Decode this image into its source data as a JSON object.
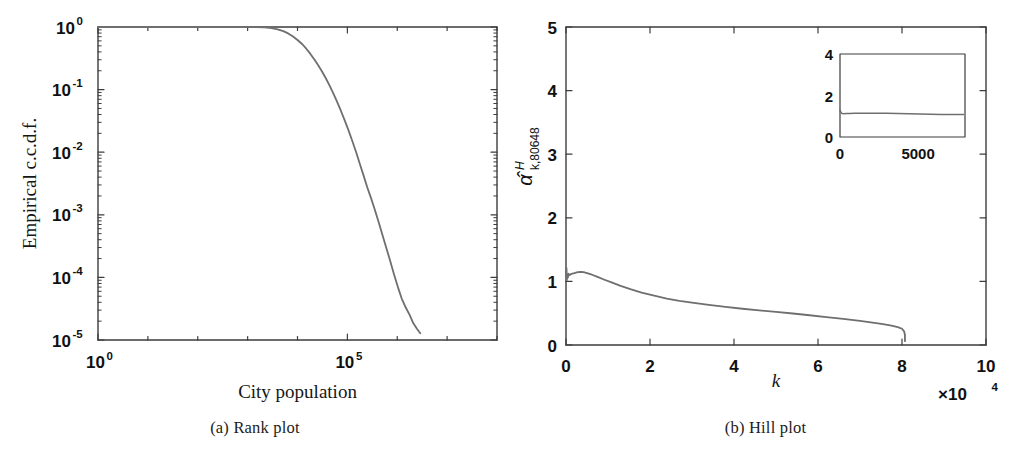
{
  "figure": {
    "background": "#ffffff",
    "curve_color": "#6f6f6f",
    "axis_color": "#3d3d3d",
    "text_color": "#111111"
  },
  "panels": [
    {
      "id": "a",
      "caption": "(a) Rank plot",
      "chart_data": {
        "type": "line",
        "title": "",
        "xlabel": "City population",
        "ylabel": "Empirical c.c.d.f.",
        "xscale": "log",
        "yscale": "log",
        "xlim": [
          1,
          100000000
        ],
        "ylim": [
          1e-05,
          1
        ],
        "grid": false,
        "legend": null,
        "xticks": [
          {
            "value": 1,
            "label_mantissa": "10",
            "label_exponent": "0"
          },
          {
            "value": 100000,
            "label_mantissa": "10",
            "label_exponent": "5"
          }
        ],
        "yticks": [
          {
            "value": 1,
            "label_mantissa": "10",
            "label_exponent": "0"
          },
          {
            "value": 0.1,
            "label_mantissa": "10",
            "label_exponent": "-1"
          },
          {
            "value": 0.01,
            "label_mantissa": "10",
            "label_exponent": "-2"
          },
          {
            "value": 0.001,
            "label_mantissa": "10",
            "label_exponent": "-3"
          },
          {
            "value": 0.0001,
            "label_mantissa": "10",
            "label_exponent": "-4"
          },
          {
            "value": 1e-05,
            "label_mantissa": "10",
            "label_exponent": "-5"
          }
        ],
        "series": [
          {
            "name": "empirical ccdf of city population",
            "points": [
              [
                1,
                1.0
              ],
              [
                10,
                1.0
              ],
              [
                100,
                1.0
              ],
              [
                300,
                1.0
              ],
              [
                800,
                0.999
              ],
              [
                1500,
                0.996
              ],
              [
                2200,
                0.985
              ],
              [
                3000,
                0.96
              ],
              [
                4000,
                0.92
              ],
              [
                5200,
                0.86
              ],
              [
                6500,
                0.79
              ],
              [
                8000,
                0.71
              ],
              [
                10000,
                0.62
              ],
              [
                12500,
                0.53
              ],
              [
                15000,
                0.45
              ],
              [
                18000,
                0.375
              ],
              [
                22000,
                0.3
              ],
              [
                26000,
                0.245
              ],
              [
                31000,
                0.195
              ],
              [
                37000,
                0.152
              ],
              [
                44000,
                0.116
              ],
              [
                52000,
                0.088
              ],
              [
                62000,
                0.064
              ],
              [
                74000,
                0.046
              ],
              [
                88000,
                0.0325
              ],
              [
                105000,
                0.0225
              ],
              [
                125000,
                0.0152
              ],
              [
                150000,
                0.01
              ],
              [
                178000,
                0.0065
              ],
              [
                210000,
                0.0043
              ],
              [
                250000,
                0.00275
              ],
              [
                295000,
                0.0019
              ],
              [
                350000,
                0.00125
              ],
              [
                420000,
                0.00078
              ],
              [
                500000,
                0.00049
              ],
              [
                600000,
                0.0003
              ],
              [
                720000,
                0.000185
              ],
              [
                860000,
                0.000112
              ],
              [
                1030000,
                7e-05
              ],
              [
                1230000,
                4.6e-05
              ],
              [
                1480000,
                3.3e-05
              ],
              [
                1780000,
                2.5e-05
              ],
              [
                2100000,
                1.85e-05
              ],
              [
                2500000,
                1.5e-05
              ],
              [
                2750000,
                1.35e-05
              ],
              [
                2900000,
                1.28e-05
              ]
            ]
          }
        ]
      }
    },
    {
      "id": "b",
      "caption": "(b) Hill plot",
      "chart_data": {
        "type": "line",
        "title": "",
        "xlabel": "k",
        "ylabel": "α̂",
        "ylabel_superscript": "H",
        "ylabel_subscript": "k,80648",
        "xscale": "linear",
        "yscale": "linear",
        "xlim": [
          0,
          10
        ],
        "ylim": [
          0,
          5
        ],
        "x_exponent_label": "×10",
        "x_exponent_power": "4",
        "grid": false,
        "legend": null,
        "xticks": [
          0,
          2,
          4,
          6,
          8,
          10
        ],
        "yticks": [
          0,
          1,
          2,
          3,
          4,
          5
        ],
        "series": [
          {
            "name": "Hill estimator",
            "points": [
              [
                0.0,
                1.1
              ],
              [
                0.012,
                1.21
              ],
              [
                0.02,
                1.02
              ],
              [
                0.03,
                1.11
              ],
              [
                0.045,
                1.06
              ],
              [
                0.06,
                1.12
              ],
              [
                0.09,
                1.1
              ],
              [
                0.13,
                1.12
              ],
              [
                0.2,
                1.13
              ],
              [
                0.28,
                1.145
              ],
              [
                0.35,
                1.15
              ],
              [
                0.42,
                1.145
              ],
              [
                0.5,
                1.13
              ],
              [
                0.62,
                1.105
              ],
              [
                0.75,
                1.07
              ],
              [
                0.9,
                1.03
              ],
              [
                1.1,
                0.98
              ],
              [
                1.3,
                0.93
              ],
              [
                1.55,
                0.875
              ],
              [
                1.8,
                0.825
              ],
              [
                2.1,
                0.775
              ],
              [
                2.4,
                0.73
              ],
              [
                2.7,
                0.695
              ],
              [
                3.0,
                0.665
              ],
              [
                3.4,
                0.63
              ],
              [
                3.8,
                0.6
              ],
              [
                4.2,
                0.57
              ],
              [
                4.6,
                0.545
              ],
              [
                5.0,
                0.52
              ],
              [
                5.4,
                0.495
              ],
              [
                5.8,
                0.468
              ],
              [
                6.2,
                0.44
              ],
              [
                6.6,
                0.41
              ],
              [
                7.0,
                0.378
              ],
              [
                7.3,
                0.352
              ],
              [
                7.55,
                0.328
              ],
              [
                7.75,
                0.305
              ],
              [
                7.9,
                0.282
              ],
              [
                8.0,
                0.255
              ],
              [
                8.05,
                0.215
              ],
              [
                8.07,
                0.16
              ],
              [
                8.07,
                0.06
              ]
            ]
          }
        ],
        "inset": {
          "xlim": [
            0,
            8000
          ],
          "ylim": [
            0,
            4
          ],
          "xticks": [
            {
              "value": 0,
              "label": "0"
            },
            {
              "value": 5000,
              "label": "5000"
            }
          ],
          "yticks": [
            {
              "value": 0,
              "label": "0"
            },
            {
              "value": 2,
              "label": "2"
            },
            {
              "value": 4,
              "label": "4"
            }
          ],
          "series": [
            {
              "name": "Hill estimator (zoom)",
              "points": [
                [
                  0,
                  1.3
                ],
                [
                  40,
                  1.22
                ],
                [
                  90,
                  1.16
                ],
                [
                  150,
                  1.13
                ],
                [
                  250,
                  1.12
                ],
                [
                  400,
                  1.13
                ],
                [
                  600,
                  1.135
                ],
                [
                  900,
                  1.14
                ],
                [
                  1300,
                  1.145
                ],
                [
                  1800,
                  1.15
                ],
                [
                  2400,
                  1.145
                ],
                [
                  3000,
                  1.14
                ],
                [
                  3700,
                  1.13
                ],
                [
                  4400,
                  1.12
                ],
                [
                  5100,
                  1.11
                ],
                [
                  5800,
                  1.1
                ],
                [
                  6500,
                  1.09
                ],
                [
                  7200,
                  1.085
                ],
                [
                  7900,
                  1.08
                ]
              ]
            }
          ]
        }
      }
    }
  ]
}
